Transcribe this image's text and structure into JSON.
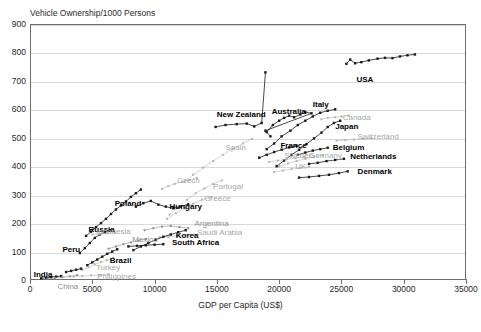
{
  "chart_data": {
    "type": "scatter",
    "title": "Vehicle Ownership/1000 Persons",
    "xlabel": "GDP per Capita (US$)",
    "ylabel": "Vehicle Ownership/1000 Persons",
    "xlim": [
      0,
      35000
    ],
    "ylim": [
      0,
      900
    ],
    "xticks": [
      0,
      5000,
      10000,
      15000,
      20000,
      25000,
      30000,
      35000
    ],
    "yticks": [
      0,
      100,
      200,
      300,
      400,
      500,
      600,
      700,
      800,
      900
    ],
    "grid": true,
    "legend": "none (series labelled in-plot)",
    "note": "Connected scatter: each country is a time-path of GDP per capita vs vehicles per 1000 persons",
    "series": [
      {
        "name": "USA",
        "emphasis": "dark",
        "label_x": 26200,
        "label_y": 700,
        "points": [
          [
            25400,
            760
          ],
          [
            25700,
            775
          ],
          [
            26100,
            762
          ],
          [
            26600,
            766
          ],
          [
            27200,
            772
          ],
          [
            27900,
            778
          ],
          [
            28500,
            781
          ],
          [
            29100,
            780
          ],
          [
            29700,
            786
          ],
          [
            30300,
            790
          ],
          [
            30900,
            793
          ]
        ]
      },
      {
        "name": "New Zealand",
        "emphasis": "dark",
        "label_x": 15000,
        "label_y": 575,
        "points": [
          [
            14900,
            538
          ],
          [
            15700,
            545
          ],
          [
            16600,
            548
          ],
          [
            17400,
            550
          ],
          [
            18000,
            540
          ],
          [
            18600,
            552
          ],
          [
            18900,
            730
          ]
        ]
      },
      {
        "name": "Australia",
        "emphasis": "dark",
        "label_x": 19400,
        "label_y": 588,
        "points": [
          [
            19000,
            520
          ],
          [
            19500,
            545
          ],
          [
            20000,
            560
          ],
          [
            20400,
            570
          ],
          [
            20800,
            578
          ],
          [
            21200,
            572
          ],
          [
            21700,
            582
          ],
          [
            22100,
            590
          ],
          [
            22600,
            586
          ],
          [
            18900,
            525
          ],
          [
            19300,
            505
          ]
        ]
      },
      {
        "name": "Italy",
        "emphasis": "dark",
        "label_x": 22700,
        "label_y": 610,
        "points": [
          [
            19000,
            460
          ],
          [
            19600,
            480
          ],
          [
            20200,
            505
          ],
          [
            20900,
            525
          ],
          [
            21500,
            545
          ],
          [
            22100,
            560
          ],
          [
            22700,
            575
          ],
          [
            23300,
            588
          ],
          [
            23900,
            595
          ],
          [
            24500,
            600
          ]
        ]
      },
      {
        "name": "Canada",
        "emphasis": "light",
        "label_x": 25100,
        "label_y": 565,
        "points": [
          [
            23400,
            565
          ],
          [
            23900,
            570
          ],
          [
            24500,
            572
          ],
          [
            25000,
            575
          ],
          [
            25600,
            578
          ]
        ]
      },
      {
        "name": "Japan",
        "emphasis": "dark",
        "label_x": 24500,
        "label_y": 535,
        "points": [
          [
            19800,
            400
          ],
          [
            20400,
            420
          ],
          [
            21000,
            440
          ],
          [
            21600,
            458
          ],
          [
            22200,
            478
          ],
          [
            22800,
            498
          ],
          [
            23400,
            518
          ],
          [
            23900,
            538
          ],
          [
            24400,
            552
          ],
          [
            24900,
            560
          ]
        ]
      },
      {
        "name": "Switzerland",
        "emphasis": "light",
        "label_x": 26300,
        "label_y": 498,
        "points": [
          [
            24600,
            490
          ],
          [
            25300,
            492
          ],
          [
            26000,
            494
          ],
          [
            26700,
            496
          ],
          [
            27400,
            498
          ]
        ]
      },
      {
        "name": "Belgium",
        "emphasis": "dark",
        "label_x": 24300,
        "label_y": 462,
        "points": [
          [
            21500,
            440
          ],
          [
            22100,
            448
          ],
          [
            22700,
            455
          ],
          [
            23300,
            460
          ],
          [
            23900,
            465
          ]
        ]
      },
      {
        "name": "Germany",
        "emphasis": "light",
        "label_x": 22400,
        "label_y": 432,
        "points": [
          [
            20000,
            400
          ],
          [
            20700,
            410
          ],
          [
            21400,
            418
          ],
          [
            22100,
            426
          ],
          [
            22800,
            432
          ],
          [
            23500,
            438
          ]
        ]
      },
      {
        "name": "Netherlands",
        "emphasis": "dark",
        "label_x": 25700,
        "label_y": 430,
        "points": [
          [
            22400,
            408
          ],
          [
            23100,
            412
          ],
          [
            23800,
            418
          ],
          [
            24500,
            422
          ],
          [
            25200,
            426
          ]
        ]
      },
      {
        "name": "France",
        "emphasis": "dark",
        "label_x": 20100,
        "label_y": 468,
        "points": [
          [
            18400,
            430
          ],
          [
            19000,
            440
          ],
          [
            19600,
            450
          ],
          [
            20200,
            458
          ],
          [
            20800,
            466
          ],
          [
            21400,
            472
          ]
        ]
      },
      {
        "name": "Sweden",
        "emphasis": "light",
        "label_x": 20400,
        "label_y": 432,
        "points": [
          [
            19200,
            415
          ],
          [
            19900,
            420
          ],
          [
            20600,
            424
          ],
          [
            21300,
            428
          ],
          [
            22000,
            432
          ]
        ]
      },
      {
        "name": "Denmark",
        "emphasis": "dark",
        "label_x": 26300,
        "label_y": 375,
        "points": [
          [
            21600,
            360
          ],
          [
            22400,
            362
          ],
          [
            23200,
            366
          ],
          [
            24000,
            370
          ],
          [
            24800,
            376
          ],
          [
            25500,
            382
          ]
        ]
      },
      {
        "name": "UK",
        "emphasis": "light",
        "label_x": 21300,
        "label_y": 392,
        "points": [
          [
            19600,
            380
          ],
          [
            20300,
            385
          ],
          [
            21000,
            390
          ],
          [
            21700,
            394
          ],
          [
            22400,
            398
          ]
        ]
      },
      {
        "name": "Spain",
        "emphasis": "light",
        "label_x": 15700,
        "label_y": 462,
        "points": [
          [
            12400,
            345
          ],
          [
            13100,
            370
          ],
          [
            13900,
            395
          ],
          [
            14700,
            418
          ],
          [
            15500,
            440
          ],
          [
            16300,
            462
          ],
          [
            17100,
            480
          ],
          [
            17800,
            496
          ]
        ]
      },
      {
        "name": "Portugal",
        "emphasis": "light",
        "label_x": 14700,
        "label_y": 322,
        "points": [
          [
            11200,
            230
          ],
          [
            11900,
            255
          ],
          [
            12600,
            282
          ],
          [
            13300,
            305
          ],
          [
            14000,
            322
          ],
          [
            14700,
            338
          ],
          [
            15400,
            350
          ]
        ]
      },
      {
        "name": "Greece",
        "emphasis": "light",
        "label_x": 14000,
        "label_y": 282,
        "points": [
          [
            11000,
            215
          ],
          [
            11700,
            235
          ],
          [
            12400,
            252
          ],
          [
            13100,
            268
          ],
          [
            13800,
            282
          ],
          [
            14500,
            292
          ]
        ]
      },
      {
        "name": "Czech",
        "emphasis": "light",
        "label_x": 11800,
        "label_y": 345,
        "points": [
          [
            10600,
            320
          ],
          [
            11100,
            330
          ],
          [
            11600,
            338
          ],
          [
            12200,
            346
          ],
          [
            12800,
            352
          ],
          [
            13400,
            358
          ]
        ]
      },
      {
        "name": "Poland",
        "emphasis": "dark",
        "label_x": 6800,
        "label_y": 265,
        "points": [
          [
            4500,
            155
          ],
          [
            4900,
            170
          ],
          [
            5300,
            186
          ],
          [
            5700,
            200
          ],
          [
            6100,
            215
          ],
          [
            6500,
            232
          ],
          [
            6900,
            248
          ],
          [
            7300,
            262
          ],
          [
            7700,
            276
          ],
          [
            8100,
            292
          ],
          [
            8500,
            305
          ],
          [
            8900,
            318
          ]
        ]
      },
      {
        "name": "Hungary",
        "emphasis": "dark",
        "label_x": 11200,
        "label_y": 252,
        "points": [
          [
            8500,
            258
          ],
          [
            9100,
            270
          ],
          [
            9700,
            278
          ],
          [
            10300,
            265
          ],
          [
            10900,
            258
          ],
          [
            11500,
            252
          ],
          [
            12100,
            258
          ],
          [
            12700,
            266
          ]
        ]
      },
      {
        "name": "Argentina",
        "emphasis": "mid",
        "label_x": 13200,
        "label_y": 192,
        "points": [
          [
            9200,
            175
          ],
          [
            9900,
            182
          ],
          [
            10600,
            188
          ],
          [
            11300,
            190
          ],
          [
            12000,
            186
          ],
          [
            12700,
            182
          ]
        ]
      },
      {
        "name": "Saudi Arabia",
        "emphasis": "light",
        "label_x": 13400,
        "label_y": 160,
        "points": [
          [
            10400,
            150
          ],
          [
            11100,
            152
          ],
          [
            11800,
            155
          ],
          [
            12500,
            158
          ],
          [
            13200,
            160
          ]
        ]
      },
      {
        "name": "Korea",
        "emphasis": "dark",
        "label_x": 11700,
        "label_y": 150,
        "points": [
          [
            8300,
            105
          ],
          [
            8900,
            118
          ],
          [
            9500,
            130
          ],
          [
            10100,
            142
          ],
          [
            10700,
            152
          ],
          [
            11300,
            160
          ],
          [
            11900,
            168
          ],
          [
            12500,
            175
          ]
        ]
      },
      {
        "name": "South Africa",
        "emphasis": "dark",
        "label_x": 11400,
        "label_y": 128,
        "points": [
          [
            7900,
            118
          ],
          [
            8600,
            120
          ],
          [
            9300,
            122
          ],
          [
            10000,
            124
          ],
          [
            10700,
            126
          ]
        ]
      },
      {
        "name": "Mexico",
        "emphasis": "mid",
        "label_x": 8200,
        "label_y": 138,
        "points": [
          [
            6300,
            110
          ],
          [
            6900,
            118
          ],
          [
            7500,
            126
          ],
          [
            8100,
            132
          ],
          [
            8700,
            138
          ],
          [
            9300,
            144
          ]
        ]
      },
      {
        "name": "Russia",
        "emphasis": "dark",
        "label_x": 4700,
        "label_y": 172,
        "points": [
          [
            4000,
            95
          ],
          [
            4400,
            112
          ],
          [
            4800,
            130
          ],
          [
            5200,
            148
          ],
          [
            5600,
            160
          ],
          [
            6000,
            168
          ],
          [
            6400,
            175
          ]
        ]
      },
      {
        "name": "Brazil",
        "emphasis": "dark",
        "label_x": 6400,
        "label_y": 62,
        "points": [
          [
            4600,
            52
          ],
          [
            5000,
            62
          ],
          [
            5400,
            72
          ],
          [
            5800,
            82
          ],
          [
            6200,
            92
          ],
          [
            6600,
            100
          ],
          [
            7000,
            108
          ]
        ]
      },
      {
        "name": "Turkey",
        "emphasis": "light",
        "label_x": 5300,
        "label_y": 40,
        "points": [
          [
            4200,
            35
          ],
          [
            4700,
            45
          ],
          [
            5200,
            55
          ],
          [
            5700,
            63
          ],
          [
            6200,
            70
          ],
          [
            6700,
            78
          ]
        ]
      },
      {
        "name": "Peru",
        "emphasis": "dark",
        "label_x": 2600,
        "label_y": 102,
        "points": [
          [
            2900,
            28
          ],
          [
            3300,
            32
          ],
          [
            3700,
            36
          ],
          [
            4100,
            40
          ]
        ]
      },
      {
        "name": "India",
        "emphasis": "dark",
        "label_x": 300,
        "label_y": 14,
        "points": [
          [
            900,
            6
          ],
          [
            1300,
            8
          ],
          [
            1700,
            10
          ],
          [
            2100,
            12
          ],
          [
            2500,
            14
          ]
        ]
      },
      {
        "name": "China",
        "emphasis": "mid",
        "label_x": 2200,
        "label_y": -28,
        "points": [
          [
            1400,
            5
          ],
          [
            2000,
            7
          ],
          [
            2600,
            10
          ],
          [
            3200,
            13
          ],
          [
            3800,
            17
          ]
        ]
      },
      {
        "name": "Philippines",
        "emphasis": "light",
        "label_x": 5400,
        "label_y": 8,
        "points": [
          [
            3500,
            12
          ],
          [
            4200,
            14
          ],
          [
            4900,
            16
          ],
          [
            5600,
            18
          ],
          [
            6300,
            20
          ]
        ]
      },
      {
        "name": "Indonesia",
        "emphasis": "light",
        "label_x": 5300,
        "label_y": 165,
        "points": [
          [
            5000,
            160
          ],
          [
            5600,
            162
          ],
          [
            6200,
            164
          ],
          [
            6800,
            166
          ]
        ]
      }
    ]
  },
  "axis": {
    "x_title": "GDP per Capita (US$)",
    "x_ticks": [
      "0",
      "5000",
      "10000",
      "15000",
      "20000",
      "25000",
      "30000",
      "35000"
    ],
    "y_ticks": [
      "900",
      "800",
      "700",
      "600",
      "500",
      "400",
      "300",
      "200",
      "100",
      "0"
    ]
  },
  "colors": {
    "frame": "#6e6e6e",
    "grid": "#d8d8d8",
    "dark_label": "#000000",
    "light_label": "#a8a8a8",
    "mid_label": "#8f8f8f",
    "dark_series": "#1a1a1a",
    "light_series": "#b5b5b5",
    "mid_series": "#8f8f8f",
    "background": "#ffffff"
  }
}
